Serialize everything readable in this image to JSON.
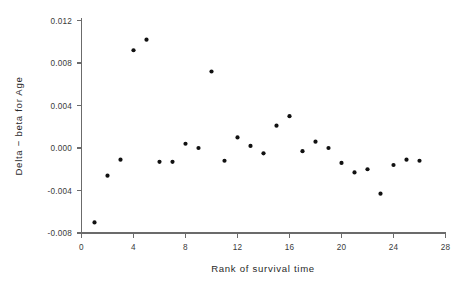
{
  "chart_data": {
    "type": "scatter",
    "title": "",
    "xlabel": "Rank of survival time",
    "ylabel": "Delta − beta for Age",
    "xlim": [
      0,
      28
    ],
    "ylim": [
      -0.008,
      0.012
    ],
    "grid": false,
    "legend": null,
    "xticks": [
      0,
      4,
      8,
      12,
      16,
      20,
      24,
      28
    ],
    "xtick_labels": [
      "0",
      "4",
      "8",
      "12",
      "16",
      "20",
      "24",
      "28"
    ],
    "yticks": [
      -0.008,
      -0.004,
      0.0,
      0.004,
      0.008,
      0.012
    ],
    "ytick_labels": [
      "-0.008",
      "-0.004",
      "0.000",
      "0.004",
      "0.008",
      "0.012"
    ],
    "marker": "filled-circle",
    "marker_color": "#111111",
    "series": [
      {
        "name": "Delta-beta for Age",
        "x": [
          1,
          2,
          3,
          4,
          5,
          6,
          7,
          8,
          9,
          10,
          11,
          12,
          13,
          14,
          15,
          16,
          17,
          18,
          19,
          20,
          21,
          22,
          23,
          24,
          25,
          26
        ],
        "y": [
          -0.007,
          -0.0026,
          -0.0011,
          0.0092,
          0.0102,
          -0.0013,
          -0.0013,
          0.0004,
          0.0,
          0.0072,
          -0.0012,
          0.001,
          0.0002,
          -0.0005,
          0.0021,
          0.003,
          -0.0003,
          0.0006,
          0.0,
          -0.0014,
          -0.0023,
          -0.002,
          -0.0043,
          -0.0016,
          -0.0011,
          -0.0012
        ]
      }
    ]
  },
  "figure": {
    "background_color": "#ffffff",
    "axis_color": "#6b6b6b"
  }
}
